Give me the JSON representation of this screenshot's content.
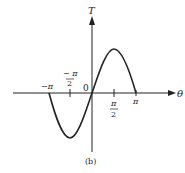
{
  "figure": {
    "caption": "(b)",
    "colors": {
      "stroke": "#222222",
      "background": "#ffffff"
    }
  },
  "axes": {
    "x_label": "θ",
    "y_label": "T",
    "origin_label": "0"
  },
  "ticks": [
    {
      "id": "neg-pi",
      "numerator": "−π",
      "denominator": ""
    },
    {
      "id": "neg-half-pi",
      "numerator": "− π",
      "denominator": "2"
    },
    {
      "id": "half-pi",
      "numerator": "π",
      "denominator": "2"
    },
    {
      "id": "pi",
      "numerator": "π",
      "denominator": ""
    }
  ],
  "curve": {
    "description": "T = sin(θ) over [−π, π]",
    "function": "sin",
    "domain": [
      "-π",
      "π"
    ]
  }
}
